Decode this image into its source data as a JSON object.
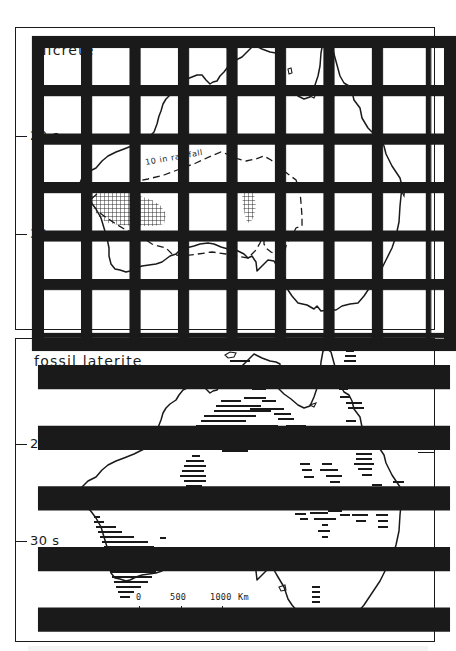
{
  "figure": {
    "panels": [
      {
        "id": "top",
        "legend_label": "silcrete",
        "legend_pattern": "cross-hatch grid",
        "isohyet_label": "10 in rainfall",
        "lat_labels": [
          "20 s",
          "30 s"
        ]
      },
      {
        "id": "bottom",
        "legend_label": "fossil laterite",
        "legend_pattern": "horizontal lines",
        "lat_labels": [
          "20 s",
          "30 s"
        ],
        "scale_bar": {
          "ticks": [
            "0",
            "500",
            "1000"
          ],
          "unit": "Km"
        }
      }
    ],
    "colors": {
      "ink": "#1a1a1a",
      "paper": "#ffffff"
    }
  }
}
